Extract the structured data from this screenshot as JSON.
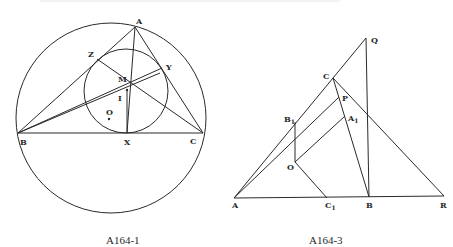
{
  "figures": [
    {
      "id": "fig1",
      "caption": "A164-1",
      "labels": {
        "A": "A",
        "B": "B",
        "C": "C",
        "X": "X",
        "Y": "Y",
        "Z": "Z",
        "M": "M",
        "I": "I",
        "O": "O"
      },
      "points": {
        "A": [
          135,
          27
        ],
        "B": [
          18,
          133
        ],
        "C": [
          203,
          133
        ],
        "X": [
          127,
          133
        ],
        "Y": [
          162,
          68
        ],
        "Z": [
          97,
          59
        ],
        "M": [
          126,
          88
        ],
        "I": [
          127,
          90
        ],
        "O": [
          109,
          119
        ]
      },
      "circumcircle": {
        "cx": 111,
        "cy": 118,
        "r": 95
      },
      "incircle": {
        "cx": 126,
        "cy": 91,
        "r": 42
      }
    },
    {
      "id": "fig2",
      "caption": "A164-3",
      "labels": {
        "A": "A",
        "B": "B",
        "C": "C",
        "Q": "Q",
        "P": "P",
        "R": "R",
        "O": "O",
        "B1": "B",
        "B1_sub": "1",
        "A1": "A",
        "A1_sub": "1",
        "C1": "C",
        "C1_sub": "1"
      },
      "points": {
        "A": [
          234,
          198
        ],
        "B": [
          369,
          197
        ],
        "C": [
          333,
          78
        ],
        "Q": [
          366,
          38
        ],
        "P": [
          339,
          97
        ],
        "A1": [
          345,
          116
        ],
        "B1": [
          295,
          122
        ],
        "O": [
          295,
          162
        ],
        "C1": [
          327,
          198
        ],
        "R": [
          444,
          196
        ]
      }
    }
  ],
  "colors": {
    "line": "#2a2a2a",
    "background": "#ffffff"
  }
}
